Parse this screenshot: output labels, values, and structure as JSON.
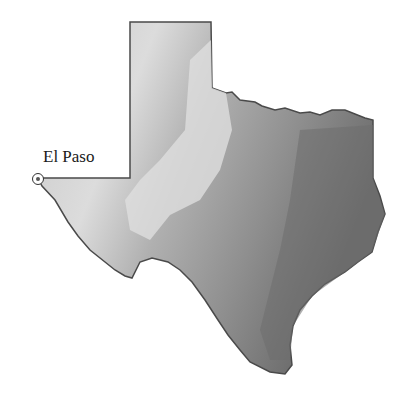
{
  "map": {
    "title": "Texas relief map",
    "colors": {
      "high_plains": "#d6d6d6",
      "central": "#b5b5b5",
      "east": "#8c8c8c",
      "coast": "#6e6e6e",
      "outline": "#4a4a4a"
    },
    "markers": [
      {
        "label": "El Paso"
      }
    ]
  }
}
